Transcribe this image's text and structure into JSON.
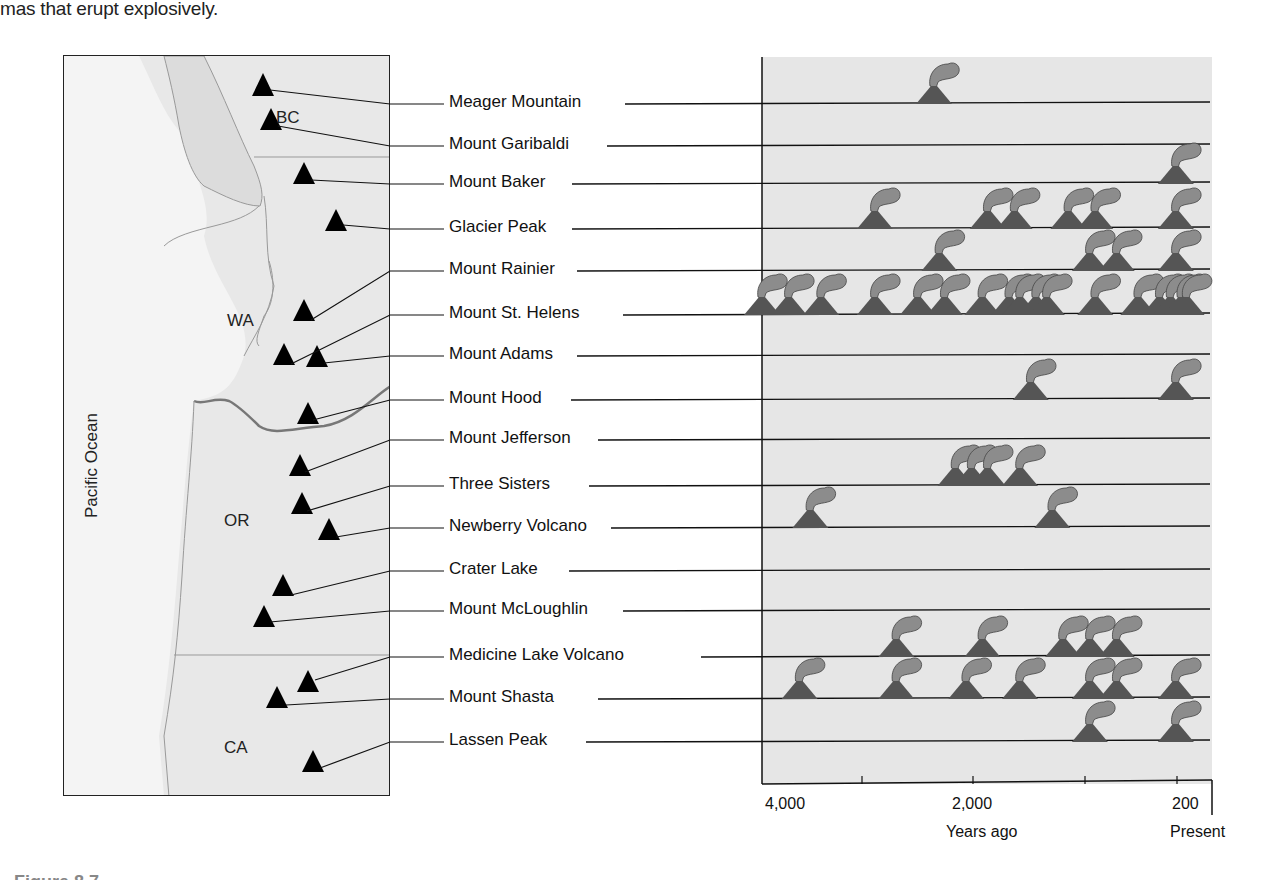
{
  "intro_text": "mas that erupt explosively.",
  "map": {
    "region_labels": {
      "bc": "BC",
      "wa": "WA",
      "or": "OR",
      "ca": "CA"
    },
    "ocean_label": "Pacific Ocean",
    "volcano_marker_icon": "black-triangle-icon"
  },
  "axis": {
    "tick_labels": [
      "4,000",
      "2,000",
      "200"
    ],
    "xlabel": "Years ago",
    "present_label": "Present"
  },
  "eruption_icon": "erupting-volcano-icon",
  "colors": {
    "plot_bg": "#e6e6e6",
    "map_land": "#e8e8e8",
    "ocean": "#f2f2f2",
    "volcano": "#555555",
    "ash": "#8a8a8a"
  },
  "chart_data": {
    "type": "scatter",
    "title": "",
    "xlabel": "Years ago",
    "ylabel": "",
    "x_axis_reversed": true,
    "xlim": [
      4000,
      0
    ],
    "x_ticks": [
      4000,
      3000,
      2000,
      1000,
      200
    ],
    "x_tick_labels": [
      "4,000",
      "",
      "2,000",
      "",
      "200"
    ],
    "x_end_label": "Present",
    "grid": false,
    "legend": null,
    "categories": [
      "Meager Mountain",
      "Mount Garibaldi",
      "Mount Baker",
      "Glacier Peak",
      "Mount Rainier",
      "Mount St. Helens",
      "Mount Adams",
      "Mount Hood",
      "Mount Jefferson",
      "Three Sisters",
      "Newberry Volcano",
      "Crater Lake",
      "Mount McLoughlin",
      "Medicine Lake Volcano",
      "Mount Shasta",
      "Lassen Peak"
    ],
    "series": [
      {
        "name": "Meager Mountain",
        "eruptions_years_ago": [
          2400
        ]
      },
      {
        "name": "Mount Garibaldi",
        "eruptions_years_ago": []
      },
      {
        "name": "Mount Baker",
        "eruptions_years_ago": [
          150
        ]
      },
      {
        "name": "Glacier Peak",
        "eruptions_years_ago": [
          2950,
          1900,
          1650,
          1150,
          900,
          150
        ]
      },
      {
        "name": "Mount Rainier",
        "eruptions_years_ago": [
          2350,
          950,
          700,
          150
        ]
      },
      {
        "name": "Mount St. Helens",
        "eruptions_years_ago": [
          4000,
          3750,
          3450,
          2950,
          2550,
          2300,
          1950,
          1700,
          1600,
          1450,
          1350,
          900,
          500,
          300,
          200,
          100,
          50
        ]
      },
      {
        "name": "Mount Adams",
        "eruptions_years_ago": []
      },
      {
        "name": "Mount Hood",
        "eruptions_years_ago": [
          1500,
          150
        ]
      },
      {
        "name": "Mount Jefferson",
        "eruptions_years_ago": []
      },
      {
        "name": "Three Sisters",
        "eruptions_years_ago": [
          2200,
          2050,
          1900,
          1600
        ]
      },
      {
        "name": "Newberry Volcano",
        "eruptions_years_ago": [
          3550,
          1300
        ]
      },
      {
        "name": "Crater Lake",
        "eruptions_years_ago": []
      },
      {
        "name": "Mount McLoughlin",
        "eruptions_years_ago": []
      },
      {
        "name": "Medicine Lake Volcano",
        "eruptions_years_ago": [
          2750,
          1950,
          1200,
          950,
          700
        ]
      },
      {
        "name": "Mount Shasta",
        "eruptions_years_ago": [
          3650,
          2750,
          2100,
          1600,
          950,
          700,
          150
        ]
      },
      {
        "name": "Lassen Peak",
        "eruptions_years_ago": [
          950,
          150
        ]
      }
    ]
  },
  "caption_fragment": "Figure 8.7"
}
